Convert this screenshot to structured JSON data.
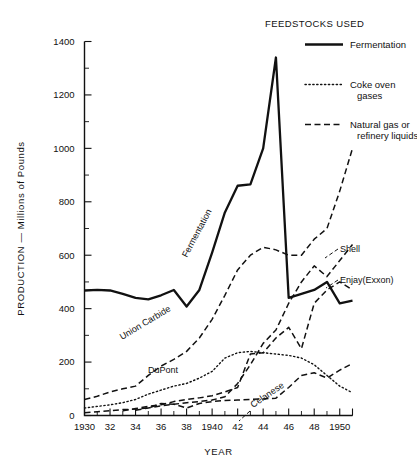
{
  "chart_data": {
    "type": "line",
    "title": "",
    "xlabel": "YEAR",
    "ylabel": "PRODUCTION — Millions of Pounds",
    "xlim": [
      1930,
      1951
    ],
    "ylim": [
      0,
      1400
    ],
    "xticks": [
      1930,
      1932,
      1934,
      1936,
      1938,
      1940,
      1942,
      1944,
      1946,
      1948,
      1950
    ],
    "xtick_labels": [
      "1930",
      "32",
      "34",
      "36",
      "38",
      "1940",
      "42",
      "44",
      "46",
      "48",
      "1950"
    ],
    "xtick_minor_step": 1,
    "yticks": [
      0,
      200,
      400,
      600,
      800,
      1000,
      1200,
      1400
    ],
    "ytick_labels": [
      "0",
      "200",
      "400",
      "600",
      "800",
      "1000",
      "1200",
      "1400"
    ],
    "ytick_minor_step": 100,
    "grid": false,
    "legend_position": "top-right",
    "series": [
      {
        "name": "Fermentation",
        "style": "solid",
        "feedstock": "Fermentation",
        "x": [
          1930,
          1931,
          1932,
          1933,
          1934,
          1935,
          1936,
          1937,
          1938,
          1939,
          1940,
          1941,
          1942,
          1943,
          1944,
          1945,
          1946,
          1947,
          1948,
          1949,
          1950,
          1951
        ],
        "y": [
          468,
          470,
          468,
          455,
          440,
          435,
          450,
          470,
          408,
          470,
          610,
          760,
          860,
          865,
          1000,
          1340,
          440,
          455,
          470,
          500,
          420,
          430
        ]
      },
      {
        "name": "Union Carbide",
        "style": "dashed",
        "feedstock": "Natural gas or refinery liquids",
        "x": [
          1930,
          1931,
          1932,
          1933,
          1934,
          1935,
          1936,
          1937,
          1938,
          1939,
          1940,
          1941,
          1942,
          1943,
          1944,
          1945,
          1946,
          1947,
          1948,
          1949,
          1950,
          1951
        ],
        "y": [
          60,
          72,
          88,
          100,
          110,
          150,
          185,
          210,
          240,
          290,
          360,
          450,
          545,
          600,
          630,
          620,
          600,
          600,
          660,
          700,
          840,
          1000
        ]
      },
      {
        "name": "DuPont",
        "style": "dotted",
        "feedstock": "Coke oven gases",
        "x": [
          1930,
          1931,
          1932,
          1933,
          1934,
          1935,
          1936,
          1937,
          1938,
          1939,
          1940,
          1941,
          1942,
          1943,
          1944,
          1945,
          1946,
          1947,
          1948,
          1949,
          1950,
          1951
        ],
        "y": [
          28,
          34,
          40,
          48,
          60,
          80,
          95,
          110,
          120,
          140,
          165,
          215,
          235,
          240,
          235,
          230,
          225,
          215,
          190,
          150,
          110,
          85
        ]
      },
      {
        "name": "Shell",
        "style": "dashed",
        "feedstock": "Natural gas or refinery liquids",
        "x": [
          1934,
          1935,
          1936,
          1937,
          1938,
          1939,
          1940,
          1941,
          1942,
          1943,
          1944,
          1945,
          1946,
          1947,
          1948,
          1949,
          1950,
          1951
        ],
        "y": [
          20,
          28,
          36,
          42,
          48,
          52,
          58,
          70,
          120,
          190,
          270,
          320,
          420,
          500,
          560,
          520,
          580,
          640
        ]
      },
      {
        "name": "Enjay(Exxon)",
        "style": "dashed",
        "feedstock": "Natural gas or refinery liquids",
        "x": [
          1933,
          1934,
          1935,
          1936,
          1937,
          1938,
          1939,
          1940,
          1941,
          1942,
          1943,
          1944,
          1945,
          1946,
          1947,
          1948,
          1949,
          1950,
          1951
        ],
        "y": [
          18,
          26,
          34,
          40,
          52,
          60,
          66,
          74,
          88,
          105,
          230,
          235,
          290,
          330,
          250,
          420,
          470,
          500,
          470
        ]
      },
      {
        "name": "Celanese",
        "style": "dashed",
        "feedstock": "Natural gas or refinery liquids",
        "x": [
          1930,
          1931,
          1932,
          1933,
          1934,
          1935,
          1936,
          1937,
          1938,
          1939,
          1940,
          1941,
          1942,
          1943,
          1944,
          1945,
          1946,
          1947,
          1948,
          1949,
          1950,
          1951
        ],
        "y": [
          10,
          14,
          18,
          22,
          24,
          28,
          45,
          42,
          28,
          45,
          52,
          56,
          58,
          60,
          62,
          65,
          105,
          150,
          160,
          140,
          170,
          195
        ]
      }
    ],
    "annotations": [
      {
        "text": "Fermentation",
        "kind": "inline-rotated"
      },
      {
        "text": "Union Carbide",
        "kind": "inline-rotated"
      },
      {
        "text": "DuPont",
        "kind": "inline"
      },
      {
        "text": "Celanese",
        "kind": "inline-rotated-leader"
      },
      {
        "text": "Shell",
        "kind": "callout-leader"
      },
      {
        "text": "Enjay(Exxon)",
        "kind": "callout-leader"
      }
    ]
  },
  "legend": {
    "title": "FEEDSTOCKS USED",
    "items": [
      {
        "label": "Fermentation",
        "style": "solid"
      },
      {
        "label": "Coke oven\ngases",
        "line1": "Coke oven",
        "line2": "gases",
        "style": "dotted"
      },
      {
        "label": "Natural gas or\nrefinery liquids",
        "line1": "Natural gas or",
        "line2": "refinery liquids",
        "style": "dashed"
      }
    ]
  }
}
